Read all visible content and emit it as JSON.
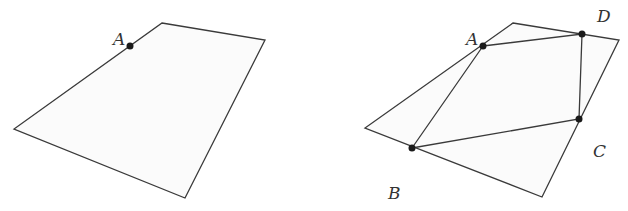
{
  "figures": [
    {
      "name": "left-quadrilateral",
      "outline": [
        [
          162,
          23
        ],
        [
          265,
          40
        ],
        [
          185,
          198
        ],
        [
          14,
          129
        ]
      ],
      "points": [
        {
          "label": "A",
          "x": 130,
          "y": 46,
          "lx": 113,
          "ly": 45
        }
      ],
      "segments": []
    },
    {
      "name": "right-quadrilateral",
      "outline": [
        [
          513,
          23
        ],
        [
          619,
          40
        ],
        [
          542,
          197
        ],
        [
          365,
          128
        ]
      ],
      "points": [
        {
          "label": "A",
          "x": 483,
          "y": 46,
          "lx": 466,
          "ly": 45
        },
        {
          "label": "D",
          "x": 582,
          "y": 34,
          "lx": 597,
          "ly": 22
        },
        {
          "label": "C",
          "x": 579,
          "y": 119,
          "lx": 593,
          "ly": 157
        },
        {
          "label": "B",
          "x": 412,
          "y": 148,
          "lx": 388,
          "ly": 199
        }
      ],
      "segments": [
        [
          "A",
          "D"
        ],
        [
          "D",
          "C"
        ],
        [
          "C",
          "B"
        ],
        [
          "B",
          "A"
        ]
      ]
    }
  ],
  "colors": {
    "line": "#3a3a3a",
    "point": "#1a1a1a",
    "fill": "#fbfbfb",
    "label": "#333333"
  }
}
